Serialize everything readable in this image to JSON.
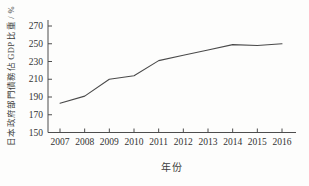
{
  "chart_data": {
    "type": "line",
    "title": "",
    "x": [
      2007,
      2008,
      2009,
      2010,
      2011,
      2012,
      2013,
      2014,
      2015,
      2016
    ],
    "values": [
      183,
      191,
      210,
      214,
      231,
      237,
      243,
      249,
      248,
      250
    ],
    "series_name": "日本政府部門債務佔GDP比重",
    "xlabel": "年份",
    "ylabel": "日本政府部門債務佔 GDP 比重 / %",
    "ylim": [
      150,
      270
    ],
    "yticks": [
      150,
      170,
      190,
      210,
      230,
      250,
      270
    ],
    "grid": false,
    "legend_position": "none",
    "line_color": "#4a4a4a",
    "axis_color": "#4d4d4d",
    "tick_label_color": "#333333",
    "background_color": "#fdfdfc"
  }
}
